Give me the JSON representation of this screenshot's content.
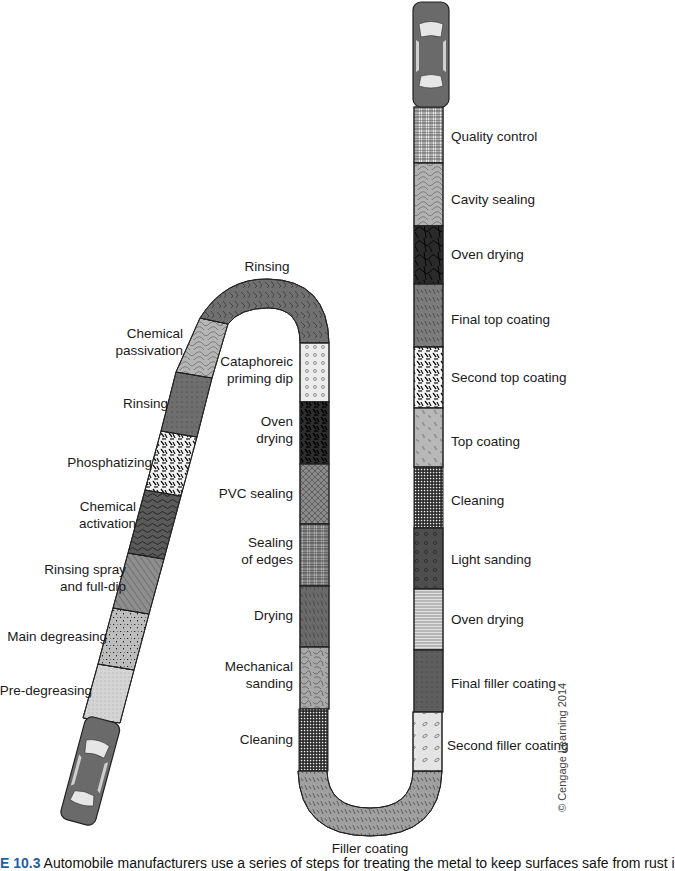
{
  "diagram": {
    "type": "process-flow",
    "start_marker": "car-bottom-left",
    "end_marker": "car-top-right",
    "path_segments": {
      "left_diagonal_bottom_to_top": [
        {
          "label": "Pre-degreasing",
          "fill": "#d4d4d4",
          "pattern": "fine-dots"
        },
        {
          "label": "Main degreasing",
          "fill": "#bdbdbd",
          "pattern": "speckle"
        },
        {
          "label": "Rinsing spray and full-dip",
          "fill": "#8e8e8e",
          "pattern": "diagonal-lines"
        },
        {
          "label": "Chemical activation",
          "fill": "#5a5a5a",
          "pattern": "wavy"
        },
        {
          "label": "Phosphatizing",
          "fill": "#f2f2f2",
          "pattern": "black-dashes"
        },
        {
          "label": "Rinsing",
          "fill": "#6e6e6e",
          "pattern": "dots"
        },
        {
          "label": "Chemical passivation",
          "fill": "#b5b5b5",
          "pattern": "contour"
        }
      ],
      "top_arch": {
        "label": "Rinsing",
        "fill": "#707070",
        "pattern": "zigzag"
      },
      "middle_column_top_to_bottom": [
        {
          "label": "Cataphoreic priming dip",
          "fill": "#ececec",
          "pattern": "circles"
        },
        {
          "label": "Oven drying",
          "fill": "#2e2e2e",
          "pattern": "dashes"
        },
        {
          "label": "PVC sealing",
          "fill": "#8a8a8a",
          "pattern": "crosshatch"
        },
        {
          "label": "Sealing of edges",
          "fill": "#b0b0b0",
          "pattern": "grid-irregular"
        },
        {
          "label": "Drying",
          "fill": "#6a6a6a",
          "pattern": "strokes"
        },
        {
          "label": "Mechanical sanding",
          "fill": "#a8a8a8",
          "pattern": "squiggles"
        },
        {
          "label": "Cleaning",
          "fill": "#4a4a4a",
          "pattern": "grid"
        }
      ],
      "bottom_u": {
        "label": "Filler coating",
        "fill": "#a0a0a0",
        "pattern": "strokes"
      },
      "right_column_bottom_to_top": [
        {
          "label": "Second filler coating",
          "fill": "#e4e4e4",
          "pattern": "ovals"
        },
        {
          "label": "Final filler coating",
          "fill": "#5e5e5e",
          "pattern": "dots"
        },
        {
          "label": "Oven drying",
          "fill": "#d8d8d8",
          "pattern": "horizontal-lines"
        },
        {
          "label": "Light sanding",
          "fill": "#4e4e4e",
          "pattern": "circles"
        },
        {
          "label": "Cleaning",
          "fill": "#3a3a3a",
          "pattern": "grid"
        },
        {
          "label": "Top coating",
          "fill": "#b8b8b8",
          "pattern": "double-strokes"
        },
        {
          "label": "Second top coating",
          "fill": "#f4f4f4",
          "pattern": "black-blobs"
        },
        {
          "label": "Final top coating",
          "fill": "#7c7c7c",
          "pattern": "strokes"
        },
        {
          "label": "Oven drying",
          "fill": "#2a2a2a",
          "pattern": "cracks"
        },
        {
          "label": "Cavity sealing",
          "fill": "#b2b2b2",
          "pattern": "contour"
        },
        {
          "label": "Quality control",
          "fill": "#9a9a9a",
          "pattern": "grid-irregular"
        }
      ]
    },
    "labels": {
      "pre_degreasing": "Pre-degreasing",
      "main_degreasing": "Main degreasing",
      "rinsing_spray_1": "Rinsing spray",
      "rinsing_spray_2": "and full-dip",
      "chem_activation_1": "Chemical",
      "chem_activation_2": "activation",
      "phosphatizing": "Phosphatizing",
      "rinsing_left": "Rinsing",
      "chem_passivation_1": "Chemical",
      "chem_passivation_2": "passivation",
      "rinsing_top": "Rinsing",
      "cataphoreic_1": "Cataphoreic",
      "cataphoreic_2": "priming dip",
      "oven_drying_mid_1": "Oven",
      "oven_drying_mid_2": "drying",
      "pvc_sealing": "PVC sealing",
      "sealing_edges_1": "Sealing",
      "sealing_edges_2": "of edges",
      "drying": "Drying",
      "mech_sanding_1": "Mechanical",
      "mech_sanding_2": "sanding",
      "cleaning_mid": "Cleaning",
      "filler_coating": "Filler coating",
      "second_filler": "Second filler coating",
      "final_filler": "Final filler coating",
      "oven_drying_r1": "Oven drying",
      "light_sanding": "Light sanding",
      "cleaning_r": "Cleaning",
      "top_coating": "Top coating",
      "second_top": "Second top coating",
      "final_top": "Final top coating",
      "oven_drying_r2": "Oven drying",
      "cavity_sealing": "Cavity sealing",
      "quality_control": "Quality control"
    }
  },
  "caption": {
    "figure_number": "E 10.3",
    "text": " Automobile manufacturers use a series of steps for treating the metal to keep surfaces safe from rust i"
  },
  "copyright": "© Cengage Learning 2014"
}
